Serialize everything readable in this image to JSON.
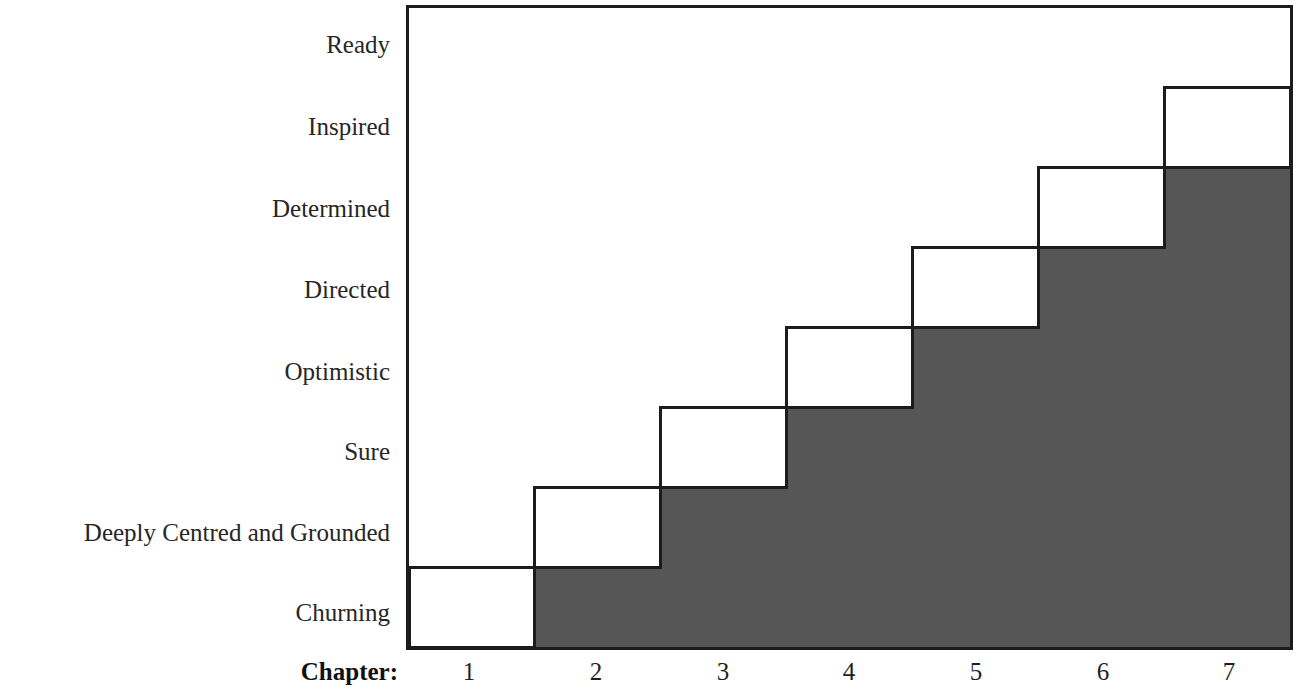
{
  "chart_data": {
    "type": "bar",
    "title": "",
    "subtitle": "",
    "xlabel": "Chapter:",
    "ylabel": "",
    "grid": false,
    "legend": null,
    "orientation": "step-staircase",
    "xlim": [
      0.5,
      7.5
    ],
    "ylim": [
      0.5,
      8.5
    ],
    "categories": [
      "1",
      "2",
      "3",
      "4",
      "5",
      "6",
      "7"
    ],
    "x_tick_labels": [
      "1",
      "2",
      "3",
      "4",
      "5",
      "6",
      "7"
    ],
    "y_tick_labels": [
      "Churning",
      "Deeply Centred and Grounded",
      "Sure",
      "Optimistic",
      "Directed",
      "Determined",
      "Inspired",
      "Ready"
    ],
    "y_levels_bottom_to_top": [
      "Churning",
      "Deeply Centred and Grounded",
      "Sure",
      "Optimistic",
      "Directed",
      "Determined",
      "Inspired",
      "Ready"
    ],
    "values": [
      1,
      2,
      3,
      4,
      5,
      6,
      7
    ],
    "series": [
      {
        "name": "Emotional state by chapter",
        "values": [
          1,
          2,
          3,
          4,
          5,
          6,
          7
        ],
        "value_labels": [
          "Churning",
          "Deeply Centred and Grounded",
          "Sure",
          "Optimistic",
          "Directed",
          "Determined",
          "Inspired"
        ]
      }
    ],
    "steps": [
      {
        "chapter": 1,
        "level": 1,
        "level_label": "Churning"
      },
      {
        "chapter": 2,
        "level": 2,
        "level_label": "Deeply Centred and Grounded"
      },
      {
        "chapter": 3,
        "level": 3,
        "level_label": "Sure"
      },
      {
        "chapter": 4,
        "level": 4,
        "level_label": "Optimistic"
      },
      {
        "chapter": 5,
        "level": 5,
        "level_label": "Directed"
      },
      {
        "chapter": 6,
        "level": 6,
        "level_label": "Determined"
      },
      {
        "chapter": 7,
        "level": 7,
        "level_label": "Inspired"
      }
    ],
    "colors": {
      "fill": "#565656",
      "line": "#1c1c1c",
      "background": "#ffffff",
      "text": "#262626"
    }
  },
  "axis": {
    "y_labels": [
      {
        "text": "Ready",
        "y": 45
      },
      {
        "text": "Inspired",
        "y": 127
      },
      {
        "text": "Determined",
        "y": 209
      },
      {
        "text": "Directed",
        "y": 290
      },
      {
        "text": "Optimistic",
        "y": 372
      },
      {
        "text": "Sure",
        "y": 452
      },
      {
        "text": "Deeply Centred and Grounded",
        "y": 533
      },
      {
        "text": "Churning",
        "y": 613
      }
    ],
    "x_title": "Chapter:",
    "x_labels": [
      {
        "text": "1",
        "x": 63
      },
      {
        "text": "2",
        "x": 190
      },
      {
        "text": "3",
        "x": 317
      },
      {
        "text": "4",
        "x": 443
      },
      {
        "text": "5",
        "x": 570
      },
      {
        "text": "6",
        "x": 697
      },
      {
        "text": "7",
        "x": 823
      }
    ]
  }
}
